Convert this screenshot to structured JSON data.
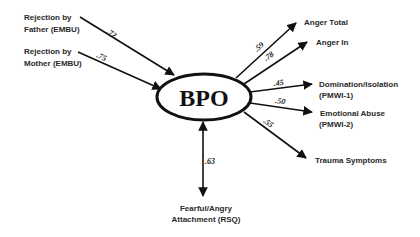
{
  "diagram": {
    "center": {
      "label": "BPO"
    },
    "inputs": [
      {
        "line1": "Rejection by",
        "line2": "Father (EMBU)",
        "coef": ".72"
      },
      {
        "line1": "Rejection by",
        "line2": "Mother (EMBU)",
        "coef": ".75"
      }
    ],
    "outputs": [
      {
        "line1": "Anger Total",
        "line2": "",
        "coef": ".59"
      },
      {
        "line1": "Anger In",
        "line2": "",
        "coef": ".78"
      },
      {
        "line1": "Domination/Isolation",
        "line2": "(PMWI-1)",
        "coef": ".45"
      },
      {
        "line1": "Emotional Abuse",
        "line2": "(PMWI-2)",
        "coef": ".50"
      },
      {
        "line1": "Trauma Symptoms",
        "line2": "",
        "coef": ".55"
      }
    ],
    "correlate": {
      "line1": "Fearful/Angry",
      "line2": "Attachment (RSQ)",
      "coef": ".63"
    }
  }
}
